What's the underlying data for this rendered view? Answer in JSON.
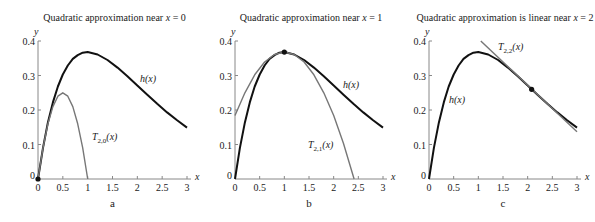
{
  "chart_data": [
    {
      "type": "line",
      "panel": "a",
      "title": "Quadratic approximation near x = 0",
      "title_parts": {
        "text": "Quadratic approximation near ",
        "var": "x",
        "rest": " = 0"
      },
      "xlabel": "x",
      "ylabel": "y",
      "xlim": [
        0,
        3
      ],
      "ylim": [
        0,
        0.4
      ],
      "xticks": [
        "0",
        "0.5",
        "1",
        "1.5",
        "2",
        "2.5",
        "3"
      ],
      "yticks": [
        "0",
        "0.1",
        "0.2",
        "0.3",
        "0.4"
      ],
      "grid": false,
      "series": [
        {
          "name": "h(x)",
          "x": [
            0,
            0.1,
            0.2,
            0.3,
            0.4,
            0.5,
            0.6,
            0.7,
            0.8,
            0.9,
            1.0,
            1.2,
            1.4,
            1.6,
            1.8,
            2.0,
            2.2,
            2.4,
            2.6,
            2.8,
            3.0
          ],
          "y": [
            0,
            0.09,
            0.164,
            0.222,
            0.268,
            0.303,
            0.329,
            0.348,
            0.359,
            0.366,
            0.368,
            0.361,
            0.345,
            0.323,
            0.298,
            0.271,
            0.244,
            0.218,
            0.193,
            0.17,
            0.149
          ]
        },
        {
          "name": "T_{2,0}(x)",
          "x": [
            0,
            0.1,
            0.2,
            0.3,
            0.4,
            0.5,
            0.6,
            0.7,
            0.8,
            0.9,
            1.0
          ],
          "y": [
            0,
            0.09,
            0.16,
            0.21,
            0.24,
            0.25,
            0.24,
            0.21,
            0.16,
            0.09,
            0
          ]
        }
      ],
      "point": {
        "x": 0,
        "y": 0
      },
      "labels": {
        "h": "h(x)",
        "t_main": "T",
        "t_sub": "2,0",
        "t_arg": "(x)"
      },
      "letter": "a"
    },
    {
      "type": "line",
      "panel": "b",
      "title": "Quadratic approximation near x = 1",
      "title_parts": {
        "text": "Quadratic approximation near ",
        "var": "x",
        "rest": " = 1"
      },
      "xlabel": "x",
      "ylabel": "y",
      "xlim": [
        0,
        3
      ],
      "ylim": [
        0,
        0.4
      ],
      "xticks": [
        "0",
        "0.5",
        "1",
        "1.5",
        "2",
        "2.5",
        "3"
      ],
      "yticks": [
        "0",
        "0.1",
        "0.2",
        "0.3",
        "0.4"
      ],
      "grid": false,
      "series": [
        {
          "name": "h(x)",
          "x": [
            0,
            0.1,
            0.2,
            0.3,
            0.4,
            0.5,
            0.6,
            0.7,
            0.8,
            0.9,
            1.0,
            1.2,
            1.4,
            1.6,
            1.8,
            2.0,
            2.2,
            2.4,
            2.6,
            2.8,
            3.0
          ],
          "y": [
            0,
            0.09,
            0.164,
            0.222,
            0.268,
            0.303,
            0.329,
            0.348,
            0.359,
            0.366,
            0.368,
            0.361,
            0.345,
            0.323,
            0.298,
            0.271,
            0.244,
            0.218,
            0.193,
            0.17,
            0.149
          ]
        },
        {
          "name": "T_{2,1}(x)",
          "x": [
            0,
            0.2,
            0.4,
            0.6,
            0.8,
            1.0,
            1.2,
            1.4,
            1.6,
            1.8,
            2.0,
            2.2,
            2.414
          ],
          "y": [
            0.184,
            0.25,
            0.302,
            0.339,
            0.361,
            0.368,
            0.361,
            0.339,
            0.302,
            0.25,
            0.184,
            0.103,
            0
          ]
        }
      ],
      "point": {
        "x": 1,
        "y": 0.368
      },
      "labels": {
        "h": "h(x)",
        "t_main": "T",
        "t_sub": "2,1",
        "t_arg": "(x)"
      },
      "letter": "b"
    },
    {
      "type": "line",
      "panel": "c",
      "title": "Quadratic approximation is linear near x = 2",
      "title_parts": {
        "text": "Quadratic approximation is linear near ",
        "var": "x",
        "rest": " = 2"
      },
      "xlabel": "x",
      "ylabel": "y",
      "xlim": [
        0,
        3
      ],
      "ylim": [
        0,
        0.4
      ],
      "xticks": [
        "0",
        "0.5",
        "1",
        "1.5",
        "2",
        "2.5",
        "3"
      ],
      "yticks": [
        "0",
        "0.1",
        "0.2",
        "0.3",
        "0.4"
      ],
      "grid": false,
      "series": [
        {
          "name": "h(x)",
          "x": [
            0,
            0.1,
            0.2,
            0.3,
            0.4,
            0.5,
            0.6,
            0.7,
            0.8,
            0.9,
            1.0,
            1.2,
            1.4,
            1.6,
            1.8,
            2.0,
            2.2,
            2.4,
            2.6,
            2.8,
            3.0
          ],
          "y": [
            0,
            0.09,
            0.164,
            0.222,
            0.268,
            0.303,
            0.329,
            0.348,
            0.359,
            0.366,
            0.368,
            0.361,
            0.345,
            0.323,
            0.298,
            0.271,
            0.244,
            0.218,
            0.193,
            0.17,
            0.149
          ]
        },
        {
          "name": "T_{2,2}(x)",
          "x": [
            1.05,
            3.0
          ],
          "y": [
            0.4,
            0.137
          ]
        }
      ],
      "point": {
        "x": 2.08,
        "y": 0.26
      },
      "labels": {
        "h": "h(x)",
        "t_main": "T",
        "t_sub": "2,2",
        "t_arg": "(x)"
      },
      "letter": "c"
    }
  ]
}
